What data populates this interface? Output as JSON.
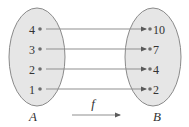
{
  "diagram": {
    "type": "function-mapping",
    "function_label": "f",
    "domain_set": {
      "name": "A",
      "elements": [
        "4",
        "3",
        "2",
        "1"
      ]
    },
    "codomain_set": {
      "name": "B",
      "elements": [
        "10",
        "7",
        "4",
        "2"
      ]
    },
    "mappings": [
      {
        "from": "4",
        "to": "10"
      },
      {
        "from": "3",
        "to": "7"
      },
      {
        "from": "2",
        "to": "4"
      },
      {
        "from": "1",
        "to": "2"
      }
    ],
    "colors": {
      "set_fill": "#e6e6e6",
      "set_stroke": "#8a8a8a",
      "line": "#8f8f8f",
      "text": "#333333"
    }
  }
}
